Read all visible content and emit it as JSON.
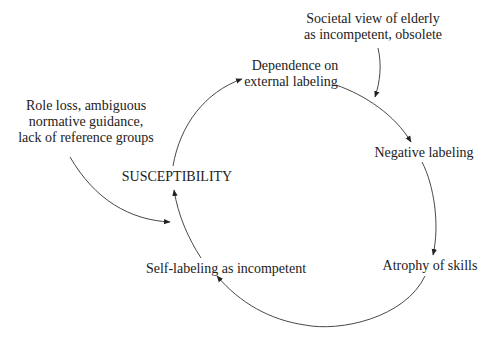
{
  "diagram": {
    "type": "causal-cycle",
    "nodes": {
      "societal_view": {
        "lines": [
          "Societal view of elderly",
          "as incompetent, obsolete"
        ]
      },
      "dependence": {
        "lines": [
          "Dependence on",
          "external labeling"
        ]
      },
      "role_loss": {
        "lines": [
          "Role loss, ambiguous",
          "normative guidance,",
          "lack of reference groups"
        ]
      },
      "susceptibility": {
        "lines": [
          "SUSCEPTIBILITY"
        ]
      },
      "negative_labeling": {
        "lines": [
          "Negative labeling"
        ]
      },
      "self_labeling": {
        "lines": [
          "Self-labeling as incompetent"
        ]
      },
      "atrophy": {
        "lines": [
          "Atrophy of skills"
        ]
      }
    },
    "edges": [
      {
        "from": "societal_view",
        "to": "negative_labeling_edge"
      },
      {
        "from": "dependence",
        "to": "negative_labeling"
      },
      {
        "from": "negative_labeling",
        "to": "atrophy"
      },
      {
        "from": "atrophy",
        "to": "self_labeling"
      },
      {
        "from": "self_labeling",
        "to": "susceptibility"
      },
      {
        "from": "role_loss",
        "to": "susceptibility"
      },
      {
        "from": "susceptibility",
        "to": "dependence"
      }
    ]
  }
}
